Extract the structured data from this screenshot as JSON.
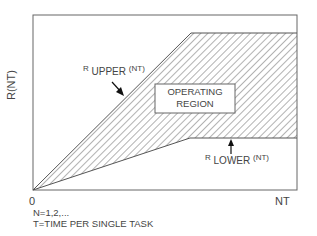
{
  "diagram": {
    "y_axis_label": "R(NT)",
    "x_axis_label": "NT",
    "origin_label": "0",
    "region_label_line1": "OPERATING",
    "region_label_line2": "REGION",
    "upper_curve": {
      "prefix": "R",
      "subscript": "UPPER",
      "suffix": "(NT)"
    },
    "lower_curve": {
      "prefix": "R",
      "subscript": "LOWER",
      "suffix": "(NT)"
    },
    "footnote_1": "N=1,2,...",
    "footnote_2": "T=TIME PER SINGLE TASK",
    "colors": {
      "line": "#555555",
      "hatch": "#666666",
      "background": "#ffffff"
    }
  }
}
